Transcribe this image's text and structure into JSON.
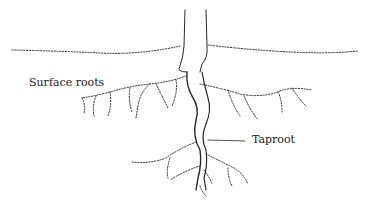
{
  "diagram": {
    "labels": {
      "surface_roots": "Surface roots",
      "taproot": "Taproot"
    },
    "colors": {
      "background": "#ffffff",
      "ink": "#2a2a2a"
    }
  }
}
